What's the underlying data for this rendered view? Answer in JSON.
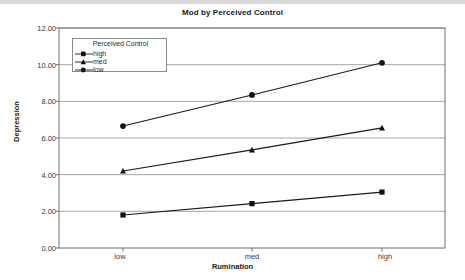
{
  "chart_data": {
    "type": "line",
    "title": "Mod by Perceived Control",
    "xlabel": "Rumination",
    "ylabel": "Depression",
    "categories": [
      "low",
      "med",
      "high"
    ],
    "ylim": [
      0.0,
      12.0
    ],
    "yticks": [
      "0.00",
      "2.00",
      "4.00",
      "6.00",
      "8.00",
      "10.00",
      "12.00"
    ],
    "ytick_values": [
      0,
      2,
      4,
      6,
      8,
      10,
      12
    ],
    "grid": "horizontal",
    "legend_position": "upper-left-inside",
    "legend_title": "Perceived Control",
    "series": [
      {
        "name": "high",
        "marker": "square",
        "values": [
          1.8,
          2.42,
          3.05
        ]
      },
      {
        "name": "med",
        "marker": "triangle",
        "values": [
          4.2,
          5.35,
          6.55
        ]
      },
      {
        "name": "low",
        "marker": "circle",
        "values": [
          6.65,
          8.35,
          10.1
        ]
      }
    ],
    "line_color": "#1a1a1a",
    "grid_color": "#a8a8a8",
    "axis_color": "#6e6e6e"
  }
}
